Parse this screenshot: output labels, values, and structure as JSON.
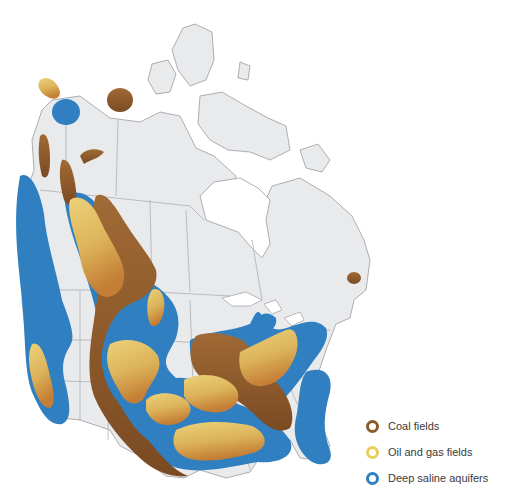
{
  "map": {
    "region": "North America (Canada and United States)",
    "land_color": "#e9eaec",
    "border_color": "#9a9ca0",
    "water_color": "#ffffff"
  },
  "legend": {
    "items": [
      {
        "label": "Coal fields",
        "color": "#8a5a2b",
        "icon": "ring-marker-icon"
      },
      {
        "label": "Oil and gas fields",
        "color": "#e8cf5a",
        "icon": "ring-marker-icon"
      },
      {
        "label": "Deep saline aquifers",
        "color": "#2f7fc1",
        "icon": "ring-marker-icon"
      }
    ]
  },
  "colors": {
    "coal": "#8a5a2b",
    "oil_gas_light": "#e3c766",
    "oil_gas_dark": "#c98b3a",
    "aquifer": "#2f7fc1"
  }
}
